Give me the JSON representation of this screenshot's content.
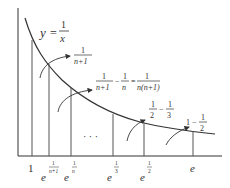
{
  "diagram": {
    "curve_label": {
      "lhs": "y",
      "eq": "=",
      "num": "1",
      "den": "x"
    },
    "axes": {
      "x_axis": true,
      "y_axis": true
    },
    "ticks": [
      {
        "id": "one",
        "base": "1",
        "exp_num": "",
        "exp_den": ""
      },
      {
        "id": "e_inv_n1",
        "base": "e",
        "exp_num": "1",
        "exp_den": "n+1"
      },
      {
        "id": "e_inv_n",
        "base": "e",
        "exp_num": "1",
        "exp_den": "n"
      },
      {
        "id": "e_third",
        "base": "e",
        "exp_num": "1",
        "exp_den": "3"
      },
      {
        "id": "e_half",
        "base": "e",
        "exp_num": "1",
        "exp_den": "2"
      },
      {
        "id": "e",
        "base": "e",
        "exp_num": "",
        "exp_den": ""
      }
    ],
    "ellipsis": "· · ·",
    "annotations": [
      {
        "id": "area_first",
        "num": "1",
        "den": "n+1"
      },
      {
        "id": "area_diff",
        "a_num": "1",
        "a_den": "n+1",
        "minus": "−",
        "b_num": "1",
        "b_den": "n",
        "eq": "=",
        "c_num": "1",
        "c_den": "n(n+1)"
      },
      {
        "id": "area_half_third",
        "a_num": "1",
        "a_den": "2",
        "minus": "−",
        "b_num": "1",
        "b_den": "3"
      },
      {
        "id": "area_one_half",
        "a": "1",
        "minus": "−",
        "b_num": "1",
        "b_den": "2"
      }
    ],
    "colors": {
      "stroke": "#333333",
      "background": "#ffffff"
    }
  }
}
